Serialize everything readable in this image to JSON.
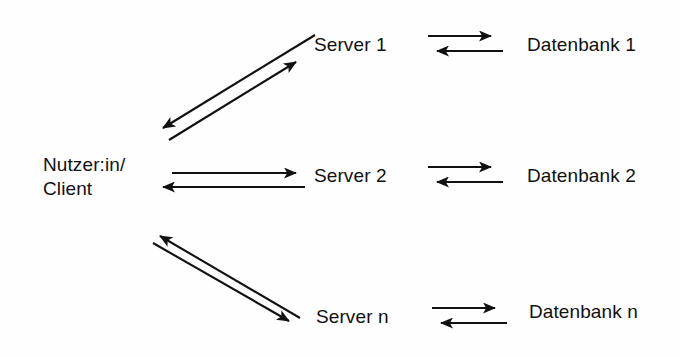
{
  "diagram": {
    "background_color": "#fefefe",
    "stroke_color": "#111111",
    "nodes": {
      "client": {
        "label_line_1": "Nutzer:in/",
        "label_line_2": "Client"
      },
      "servers": [
        {
          "label": "Server 1"
        },
        {
          "label": "Server 2"
        },
        {
          "label": "Server n"
        }
      ],
      "databases": [
        {
          "label": "Datenbank 1"
        },
        {
          "label": "Datenbank 2"
        },
        {
          "label": "Datenbank n"
        }
      ]
    },
    "connections": [
      {
        "name": "client-server-1",
        "from": "Nutzer:in/Client",
        "to": "Server 1",
        "style": "bidirectional-diagonal-up"
      },
      {
        "name": "client-server-2",
        "from": "Nutzer:in/Client",
        "to": "Server 2",
        "style": "bidirectional-horizontal"
      },
      {
        "name": "client-server-n",
        "from": "Nutzer:in/Client",
        "to": "Server n",
        "style": "bidirectional-diagonal-down"
      },
      {
        "name": "server-1-datenbank-1",
        "from": "Server 1",
        "to": "Datenbank 1",
        "style": "bidirectional-horizontal"
      },
      {
        "name": "server-2-datenbank-2",
        "from": "Server 2",
        "to": "Datenbank 2",
        "style": "bidirectional-horizontal"
      },
      {
        "name": "server-n-datenbank-n",
        "from": "Server n",
        "to": "Datenbank n",
        "style": "bidirectional-horizontal"
      }
    ]
  }
}
